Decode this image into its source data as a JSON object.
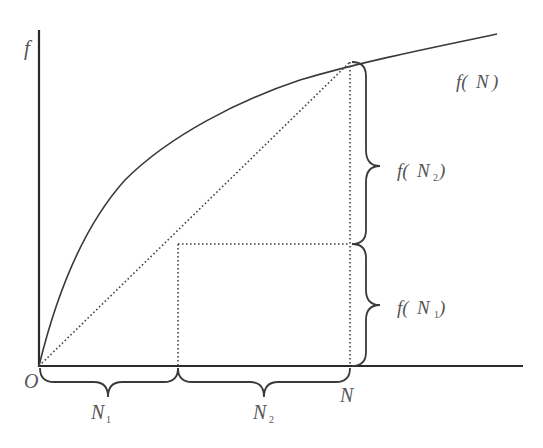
{
  "diagram": {
    "labels": {
      "y_axis": "f",
      "origin": "O",
      "curve": "f(N)",
      "curve_f": "f(",
      "curve_N": "N",
      "curve_close": ")",
      "n": "N",
      "n1_main": "N",
      "n1_sub": "1",
      "n2_main": "N",
      "n2_sub": "2",
      "fn2_prefix": "f(",
      "fn2_N": "N",
      "fn2_sub": "2",
      "fn2_close": ")",
      "fn1_prefix": "f(",
      "fn1_N": "N",
      "fn1_sub": "1",
      "fn1_close": ")"
    },
    "semantics": {
      "curve_type": "concave increasing",
      "chord": "dotted line from origin to (N, f(N))",
      "split_point": "N1 where N = N1 + N2",
      "vertical_braces": [
        "f(N2)",
        "f(N1)"
      ],
      "horizontal_braces": [
        "N1",
        "N2"
      ]
    },
    "colors": {
      "stroke": "#3a3a3a",
      "text": "#555555",
      "background": "#ffffff"
    }
  }
}
